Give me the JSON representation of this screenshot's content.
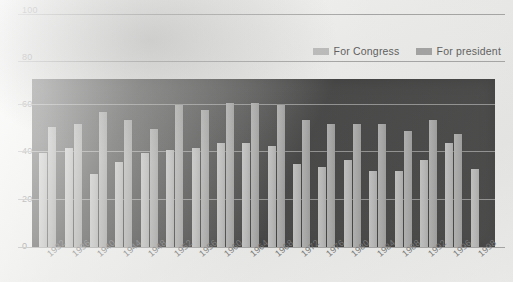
{
  "chart_data": {
    "type": "bar",
    "title": "",
    "xlabel": "",
    "ylabel": "",
    "ylim": [
      0,
      100
    ],
    "yticks": [
      0,
      20,
      40,
      60,
      80,
      100
    ],
    "grid": true,
    "legend_position": "top-right",
    "categories": [
      "1932",
      "1936",
      "1940",
      "1944",
      "1948",
      "1952",
      "1956",
      "1960",
      "1964",
      "1968",
      "1972",
      "1976",
      "1980",
      "1984",
      "1988",
      "1992",
      "1996",
      "1998"
    ],
    "series": [
      {
        "name": "For Congress",
        "color": "#a8a8a8",
        "values": [
          40,
          42,
          31,
          36,
          40,
          41,
          42,
          44,
          44,
          43,
          35,
          34,
          37,
          32,
          32,
          37,
          44,
          33
        ]
      },
      {
        "name": "For president",
        "color": "#8a8a8a",
        "values": [
          51,
          52,
          57,
          54,
          50,
          60,
          58,
          61,
          61,
          60,
          54,
          52,
          52,
          52,
          49,
          54,
          48,
          null
        ]
      }
    ]
  },
  "axis": {
    "ytick_labels": [
      "100",
      "80",
      "60",
      "40",
      "20",
      "0"
    ]
  },
  "legend": {
    "items": [
      {
        "label": "For Congress",
        "swatch": "legend-swatch-congress"
      },
      {
        "label": "For president",
        "swatch": "legend-swatch-president"
      }
    ]
  }
}
